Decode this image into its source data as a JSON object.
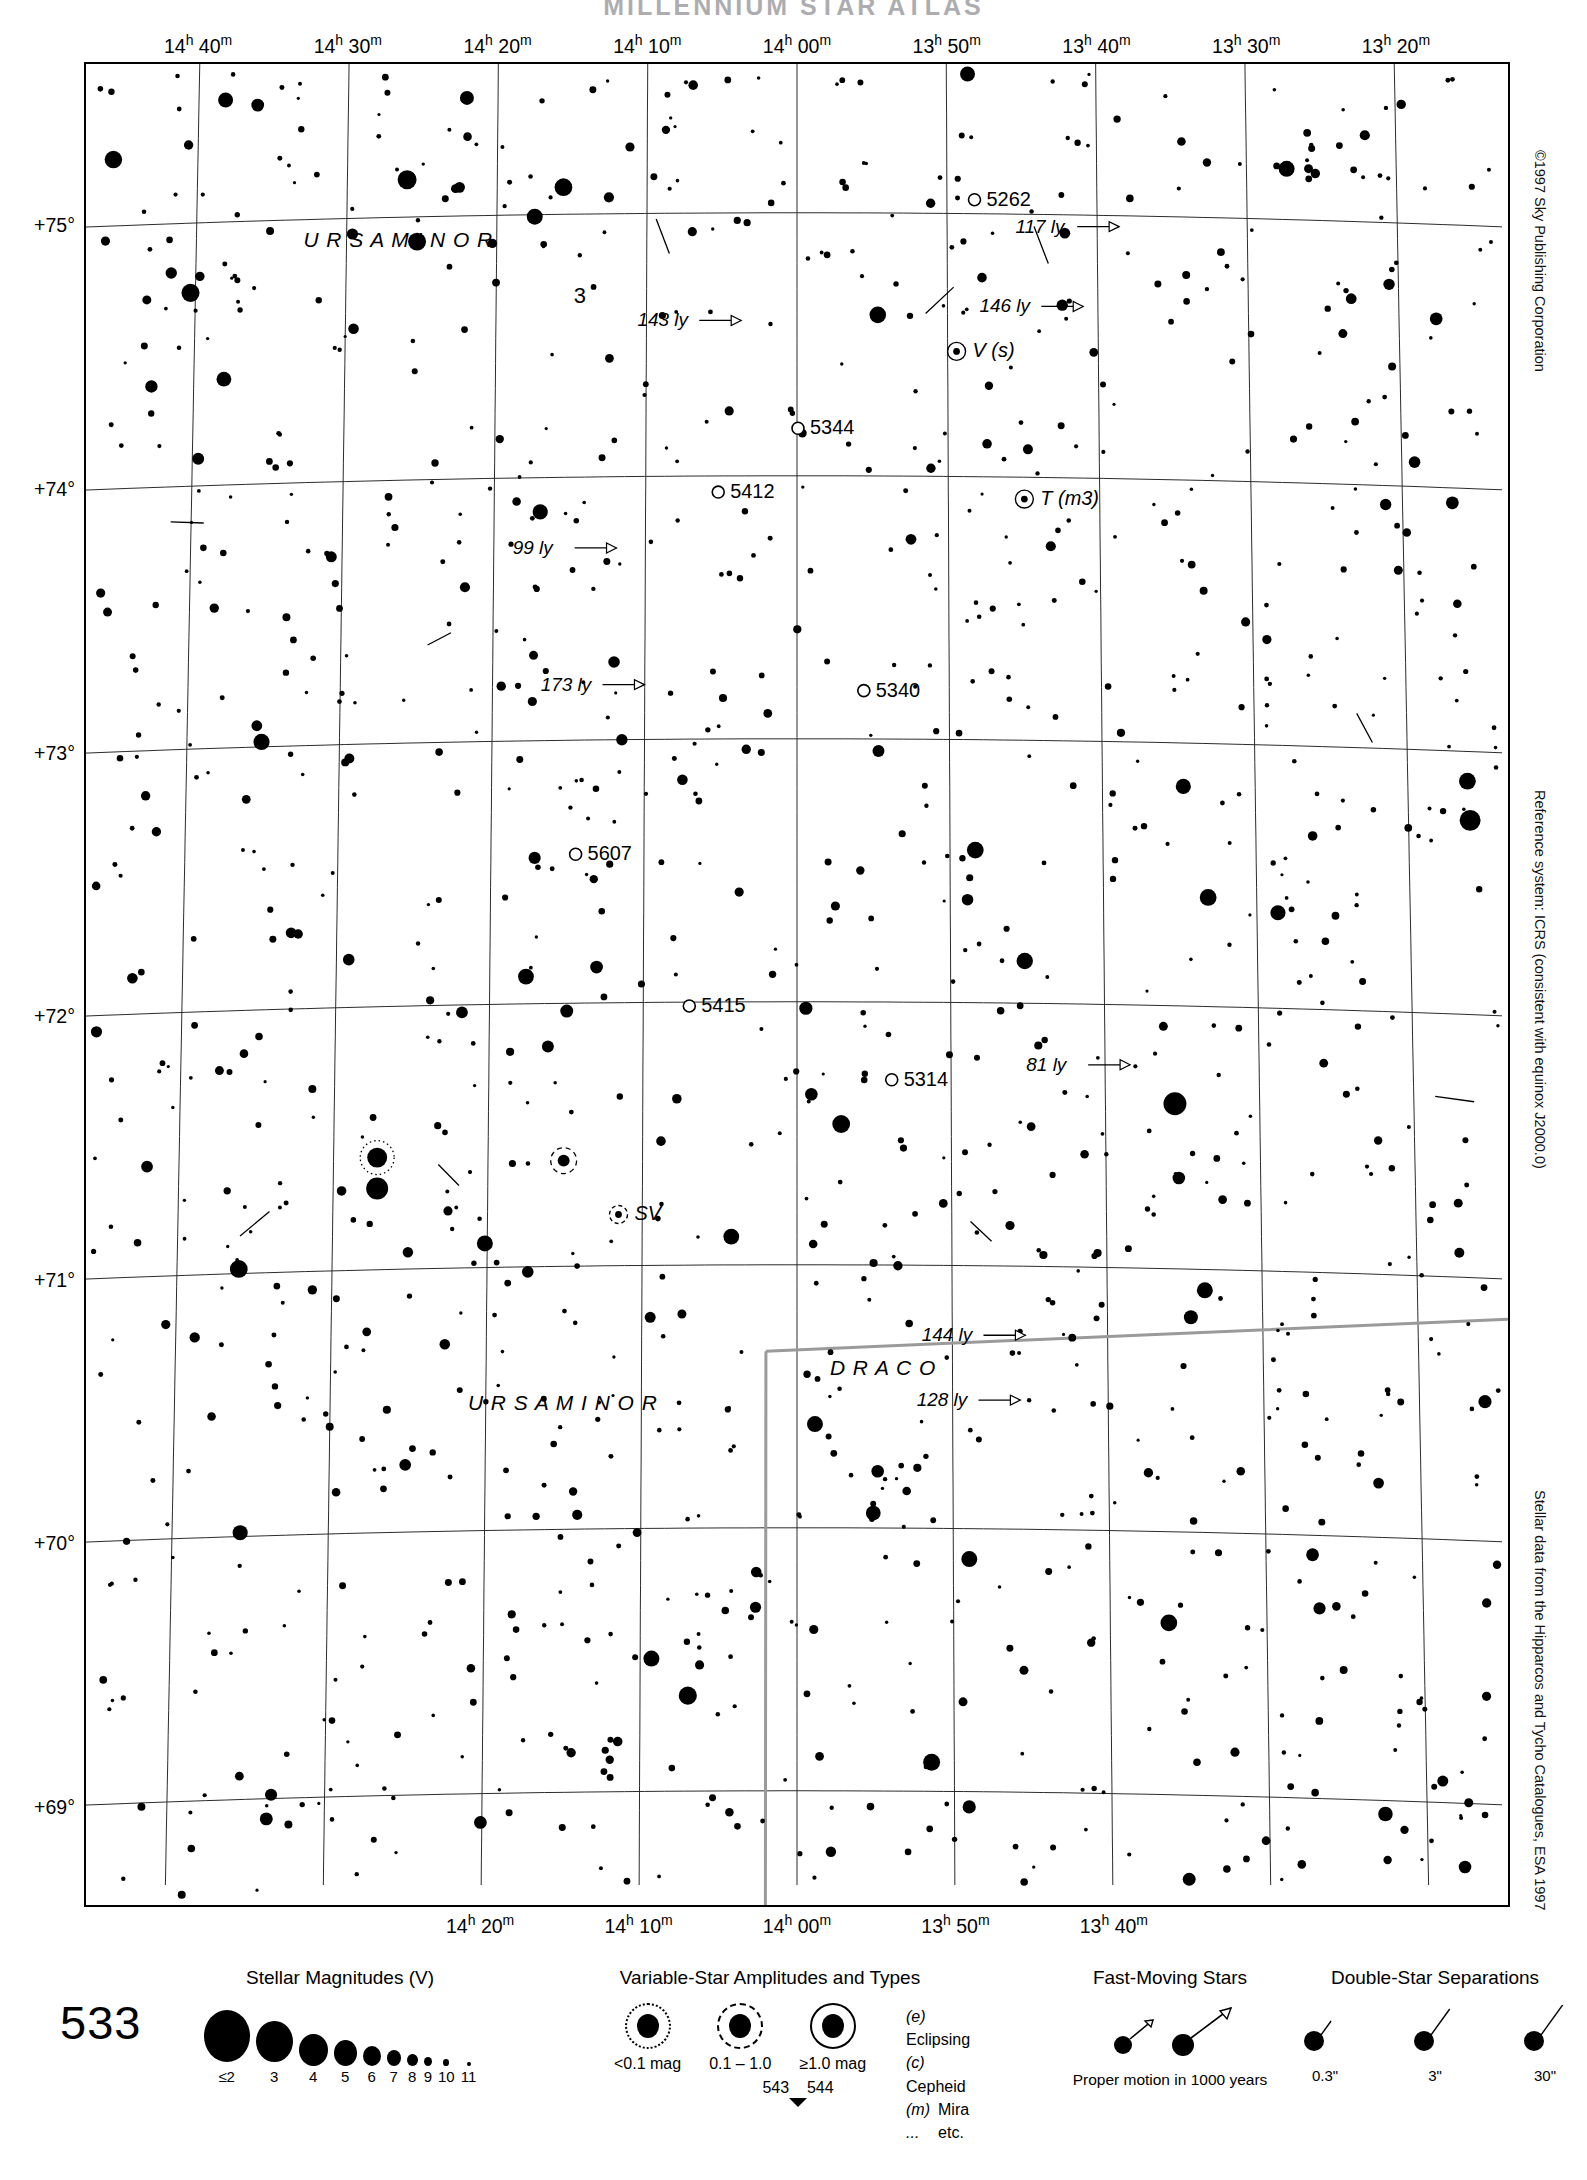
{
  "page": {
    "title": "MILLENNIUM STAR ATLAS",
    "chart_number": "533"
  },
  "side_notes": {
    "copyright": "©1997 Sky Publishing Corporation",
    "reference_system": "Reference system: ICRS (consistent with equinox J2000.0)",
    "data_source": "Stellar data from the Hipparcos and Tycho Catalogues, ESA 1997"
  },
  "chart_data": {
    "type": "scatter",
    "title": "MILLENNIUM STAR ATLAS",
    "xlabel": "Right Ascension",
    "ylabel": "Declination",
    "grid": true,
    "legend_position": "bottom",
    "xlim": [
      "14h 45m",
      "13h 15m"
    ],
    "ylim": [
      68.6,
      75.6
    ],
    "ra_ticks_top": [
      "14h 40m",
      "14h 30m",
      "14h 20m",
      "14h 10m",
      "14h 00m",
      "13h 50m",
      "13h 40m",
      "13h 30m",
      "13h 20m"
    ],
    "ra_ticks_bottom": [
      "14h 20m",
      "14h 10m",
      "14h 00m",
      "13h 50m",
      "13h 40m"
    ],
    "dec_ticks": [
      "+75°",
      "+74°",
      "+73°",
      "+72°",
      "+71°",
      "+70°",
      "+69°"
    ],
    "constellations": [
      {
        "name": "U R S A   M I N O R",
        "x": 218,
        "y": 183
      },
      {
        "name": "U R S A   M I N O R",
        "x": 383,
        "y": 1349
      },
      {
        "name": "D R A C O",
        "x": 746,
        "y": 1314
      }
    ],
    "deep_sky_objects": [
      {
        "label": "5262",
        "x": 903,
        "y": 142
      },
      {
        "label": "5344",
        "x": 726,
        "y": 371
      },
      {
        "label": "5412",
        "x": 646,
        "y": 435
      },
      {
        "label": "5340",
        "x": 792,
        "y": 634
      },
      {
        "label": "5607",
        "x": 503,
        "y": 798
      },
      {
        "label": "5415",
        "x": 617,
        "y": 950
      },
      {
        "label": "5314",
        "x": 820,
        "y": 1024
      }
    ],
    "variable_stars": [
      {
        "label": "V (s)",
        "x": 889,
        "y": 294
      },
      {
        "label": "T (m3)",
        "x": 957,
        "y": 442
      },
      {
        "label": "SV",
        "x": 550,
        "y": 1159
      }
    ],
    "flamsteed_stars": [
      {
        "label": "3",
        "x": 489,
        "y": 240
      }
    ],
    "distance_labels": [
      {
        "label": "117 ly",
        "x": 932,
        "y": 169
      },
      {
        "label": "143 ly",
        "x": 553,
        "y": 263
      },
      {
        "label": "146 ly",
        "x": 896,
        "y": 249
      },
      {
        "label": "99 ly",
        "x": 428,
        "y": 491
      },
      {
        "label": "173 ly",
        "x": 456,
        "y": 628
      },
      {
        "label": "81 ly",
        "x": 943,
        "y": 1009
      },
      {
        "label": "144 ly",
        "x": 838,
        "y": 1280
      },
      {
        "label": "128 ly",
        "x": 833,
        "y": 1345
      }
    ]
  },
  "legend": {
    "magnitudes": {
      "title": "Stellar Magnitudes (V)",
      "items": [
        {
          "label": "≤2",
          "size": 46
        },
        {
          "label": "3",
          "size": 37
        },
        {
          "label": "4",
          "size": 29
        },
        {
          "label": "5",
          "size": 23
        },
        {
          "label": "6",
          "size": 18
        },
        {
          "label": "7",
          "size": 14
        },
        {
          "label": "8",
          "size": 11
        },
        {
          "label": "9",
          "size": 8
        },
        {
          "label": "10",
          "size": 6
        },
        {
          "label": "11",
          "size": 4
        }
      ]
    },
    "variables": {
      "title": "Variable-Star Amplitudes and Types",
      "items": [
        {
          "label": "<0.1 mag",
          "ring": "dotted",
          "core": 22
        },
        {
          "label": "0.1 – 1.0",
          "ring": "dashed",
          "core": 22
        },
        {
          "label": "≥1.0 mag",
          "ring": "solid",
          "core": 22
        }
      ],
      "types": [
        {
          "code": "(e)",
          "name": "Eclipsing"
        },
        {
          "code": "(c)",
          "name": "Cepheid"
        },
        {
          "code": "(m)",
          "name": "Mira"
        },
        {
          "code": "...",
          "name": "etc."
        }
      ]
    },
    "fast_moving": {
      "title": "Fast-Moving Stars",
      "caption": "Proper motion in 1000 years"
    },
    "doubles": {
      "title": "Double-Star Separations",
      "items": [
        "0.3\"",
        "3\"",
        "30\""
      ]
    },
    "page_nav": {
      "prev": "543",
      "next": "544"
    }
  }
}
